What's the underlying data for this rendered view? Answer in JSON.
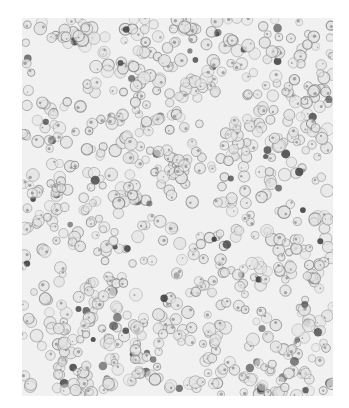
{
  "image": {
    "description": "Grayscale histology micrograph of densely packed round cells with nuclei",
    "frame": {
      "x": 22,
      "y": 18,
      "width": 311,
      "height": 378
    },
    "background_color": "#f1f1f1",
    "cell_count": 900,
    "cell_radius_range": [
      3.5,
      6.5
    ],
    "cell_outline_color": "#8a8a8a",
    "dark_nucleus_color": "#3c3c3c",
    "dark_nucleus_fraction": 0.07,
    "pale_regions": [
      {
        "cx": 40,
        "cy": 60,
        "r": 22
      },
      {
        "cx": 190,
        "cy": 95,
        "r": 20
      },
      {
        "cx": 265,
        "cy": 175,
        "r": 18
      },
      {
        "cx": 120,
        "cy": 165,
        "r": 14
      },
      {
        "cx": 60,
        "cy": 250,
        "r": 16
      },
      {
        "cx": 220,
        "cy": 330,
        "r": 18
      }
    ]
  }
}
